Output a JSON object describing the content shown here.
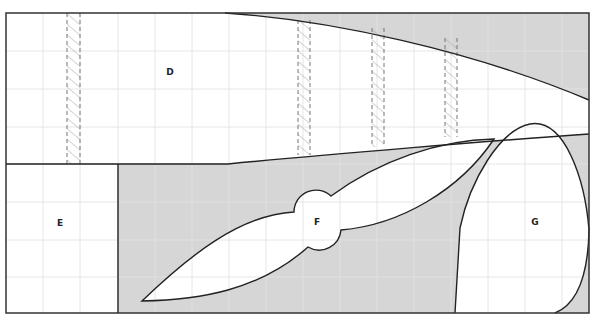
{
  "diagram": {
    "frame": {
      "x": 6,
      "y": 13,
      "width": 583,
      "height": 300
    },
    "colors": {
      "background": "#ffffff",
      "shaded": "#d6d6d6",
      "grid": "#e4e4e4",
      "stroke": "#222222",
      "hatch": "#999999"
    },
    "grid": {
      "vertical": [
        43,
        80,
        118,
        155,
        192,
        229,
        266,
        303,
        340,
        377,
        414,
        451,
        488,
        525,
        562
      ],
      "horizontal": [
        51,
        89,
        127,
        164,
        202,
        240,
        277
      ]
    },
    "hatched_columns": [
      {
        "x": 67,
        "width": 13,
        "top": 13,
        "bottom": 164
      },
      {
        "x": 298,
        "width": 12,
        "top": 20,
        "bottom": 155
      },
      {
        "x": 372,
        "width": 12,
        "top": 28,
        "bottom": 147
      },
      {
        "x": 445,
        "width": 12,
        "top": 38,
        "bottom": 137
      }
    ],
    "regions": [
      {
        "id": "D",
        "label": "D",
        "label_x": 170,
        "label_y": 71
      },
      {
        "id": "E",
        "label": "E",
        "label_x": 60,
        "label_y": 222
      },
      {
        "id": "F",
        "label": "F",
        "label_x": 317,
        "label_y": 221
      },
      {
        "id": "G",
        "label": "G",
        "label_x": 535,
        "label_y": 221
      }
    ]
  }
}
